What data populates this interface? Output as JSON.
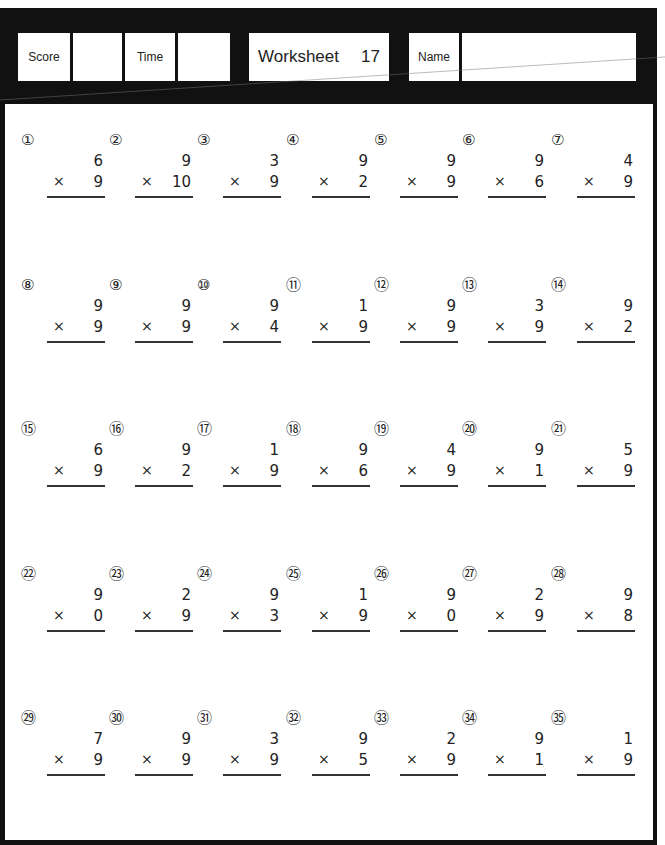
{
  "header": {
    "score_label": "Score",
    "score_value": "",
    "time_label": "Time",
    "time_value": "",
    "title": "Worksheet",
    "worksheet_number": "17",
    "name_label": "Name",
    "name_value": ""
  },
  "operator_symbol": "×",
  "problems": [
    {
      "num": "①",
      "top": "6",
      "bottom": "9"
    },
    {
      "num": "②",
      "top": "9",
      "bottom": "10"
    },
    {
      "num": "③",
      "top": "3",
      "bottom": "9"
    },
    {
      "num": "④",
      "top": "9",
      "bottom": "2"
    },
    {
      "num": "⑤",
      "top": "9",
      "bottom": "9"
    },
    {
      "num": "⑥",
      "top": "9",
      "bottom": "6"
    },
    {
      "num": "⑦",
      "top": "4",
      "bottom": "9"
    },
    {
      "num": "⑧",
      "top": "9",
      "bottom": "9"
    },
    {
      "num": "⑨",
      "top": "9",
      "bottom": "9"
    },
    {
      "num": "⑩",
      "top": "9",
      "bottom": "4"
    },
    {
      "num": "⑪",
      "top": "1",
      "bottom": "9"
    },
    {
      "num": "⑫",
      "top": "9",
      "bottom": "9"
    },
    {
      "num": "⑬",
      "top": "3",
      "bottom": "9"
    },
    {
      "num": "⑭",
      "top": "9",
      "bottom": "2"
    },
    {
      "num": "⑮",
      "top": "6",
      "bottom": "9"
    },
    {
      "num": "⑯",
      "top": "9",
      "bottom": "2"
    },
    {
      "num": "⑰",
      "top": "1",
      "bottom": "9"
    },
    {
      "num": "⑱",
      "top": "9",
      "bottom": "6"
    },
    {
      "num": "⑲",
      "top": "4",
      "bottom": "9"
    },
    {
      "num": "⑳",
      "top": "9",
      "bottom": "1"
    },
    {
      "num": "㉑",
      "top": "5",
      "bottom": "9"
    },
    {
      "num": "㉒",
      "top": "9",
      "bottom": "0"
    },
    {
      "num": "㉓",
      "top": "2",
      "bottom": "9"
    },
    {
      "num": "㉔",
      "top": "9",
      "bottom": "3"
    },
    {
      "num": "㉕",
      "top": "1",
      "bottom": "9"
    },
    {
      "num": "㉖",
      "top": "9",
      "bottom": "0"
    },
    {
      "num": "㉗",
      "top": "2",
      "bottom": "9"
    },
    {
      "num": "㉘",
      "top": "9",
      "bottom": "8"
    },
    {
      "num": "㉙",
      "top": "7",
      "bottom": "9"
    },
    {
      "num": "㉚",
      "top": "9",
      "bottom": "9"
    },
    {
      "num": "㉛",
      "top": "3",
      "bottom": "9"
    },
    {
      "num": "㉜",
      "top": "9",
      "bottom": "5"
    },
    {
      "num": "㉝",
      "top": "2",
      "bottom": "9"
    },
    {
      "num": "㉞",
      "top": "9",
      "bottom": "1"
    },
    {
      "num": "㉟",
      "top": "1",
      "bottom": "9"
    }
  ]
}
